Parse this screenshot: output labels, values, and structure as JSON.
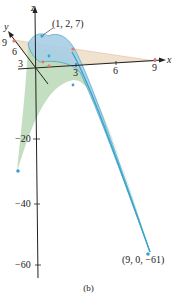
{
  "figure": {
    "caption": "(b)",
    "axes": {
      "x_label": "x",
      "y_label": "y",
      "z_label": "z",
      "x_ticks": [
        "3",
        "6",
        "9"
      ],
      "y_ticks": [
        "3",
        "6",
        "9"
      ],
      "z_ticks": [
        "−20",
        "−40",
        "−60"
      ]
    },
    "annotations": {
      "max_point": "(1, 2, 7)",
      "min_point": "(9, 0, −61)"
    },
    "colors": {
      "blue_surface": "#a9cfe6",
      "blue_edge": "#3aa3c9",
      "green_surface": "#b9d8b5",
      "tan_plane": "#efe3cf",
      "red_points": "#e4776a",
      "axis": "#222222"
    }
  }
}
